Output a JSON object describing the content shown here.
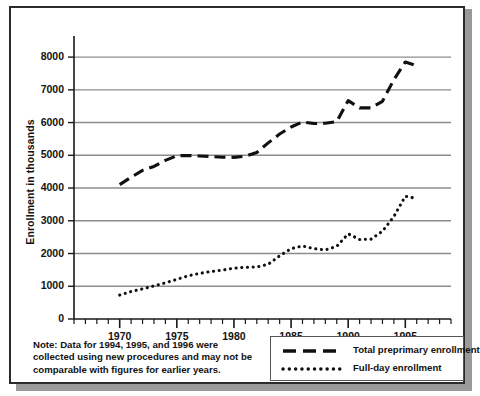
{
  "chart_data": {
    "type": "line",
    "title": "",
    "xlabel": "",
    "ylabel": "Enrollment in thousands",
    "xlim": [
      1966,
      1999
    ],
    "ylim": [
      0,
      8400
    ],
    "y_ticks": [
      0,
      1000,
      2000,
      3000,
      4000,
      5000,
      6000,
      7000,
      8000
    ],
    "x_ticks": [
      1970,
      1975,
      1980,
      1985,
      1990,
      1995
    ],
    "x_minor_tick_step": 1,
    "grid": "horizontal",
    "legend_position": "bottom-right",
    "series": [
      {
        "name": "Total preprimary enrollment",
        "style": "dashed",
        "color": "#101010",
        "x": [
          1970,
          1971,
          1972,
          1973,
          1974,
          1975,
          1976,
          1977,
          1978,
          1979,
          1980,
          1981,
          1982,
          1983,
          1984,
          1985,
          1986,
          1987,
          1988,
          1989,
          1990,
          1991,
          1992,
          1993,
          1994,
          1995,
          1996
        ],
        "values": [
          4104,
          4331,
          4540,
          4659,
          4845,
          4988,
          4996,
          4980,
          4963,
          4942,
          4938,
          4975,
          5086,
          5380,
          5650,
          5865,
          6020,
          5970,
          5980,
          6030,
          6670,
          6450,
          6450,
          6650,
          7310,
          7850,
          7740
        ]
      },
      {
        "name": "Full-day enrollment",
        "style": "dotted",
        "color": "#101010",
        "x": [
          1970,
          1971,
          1972,
          1973,
          1974,
          1975,
          1976,
          1977,
          1978,
          1979,
          1980,
          1981,
          1982,
          1983,
          1984,
          1985,
          1986,
          1987,
          1988,
          1989,
          1990,
          1991,
          1992,
          1993,
          1994,
          1995,
          1996
        ],
        "values": [
          731,
          840,
          920,
          1010,
          1105,
          1210,
          1320,
          1395,
          1450,
          1495,
          1551,
          1580,
          1590,
          1670,
          1930,
          2150,
          2230,
          2150,
          2110,
          2220,
          2600,
          2430,
          2440,
          2680,
          3130,
          3750,
          3680
        ]
      }
    ]
  },
  "note": {
    "text": "Note: Data for 1994, 1995, and 1996 were collected using new procedures and may not be comparable with figures for earlier years."
  },
  "legend": {
    "items": [
      {
        "label": "Total preprimary enrollment",
        "style": "dashed"
      },
      {
        "label": "Full-day enrollment",
        "style": "dotted"
      }
    ]
  }
}
